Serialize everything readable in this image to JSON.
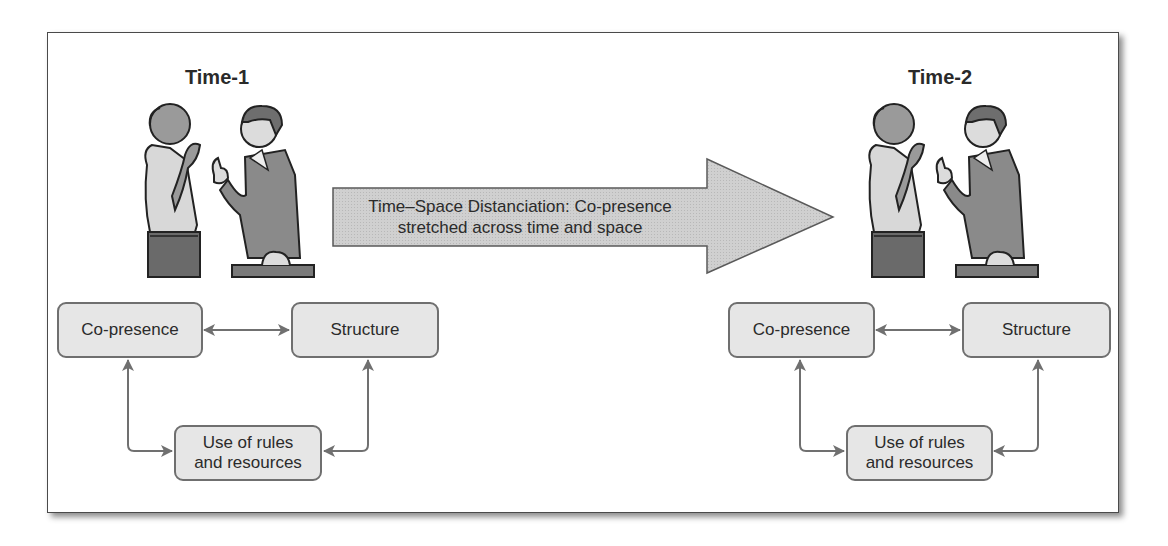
{
  "diagram": {
    "title_left": "Time-1",
    "title_right": "Time-2",
    "transition_arrow": {
      "line1": "Time–Space Distanciation: Co-presence",
      "line2": "stretched across time and space"
    },
    "left_panel": {
      "nodes": {
        "co_presence": "Co-presence",
        "structure": "Structure",
        "rules_line1": "Use of rules",
        "rules_line2": "and resources"
      }
    },
    "right_panel": {
      "nodes": {
        "co_presence": "Co-presence",
        "structure": "Structure",
        "rules_line1": "Use of rules",
        "rules_line2": "and resources"
      }
    },
    "edges": [
      {
        "from": "Co-presence",
        "to": "Structure",
        "type": "bidirectional"
      },
      {
        "from": "Co-presence",
        "to": "Use of rules and resources",
        "type": "bidirectional"
      },
      {
        "from": "Structure",
        "to": "Use of rules and resources",
        "type": "bidirectional"
      }
    ],
    "illustrations": [
      "two-men-conversing-icon (Time-1)",
      "two-men-conversing-icon (Time-2)"
    ],
    "colors": {
      "box_fill": "#e6e6e6",
      "box_border": "#6f6f6f",
      "arrow_fill": "#cfcfcf",
      "connector": "#707070",
      "text": "#2b2b2b"
    }
  }
}
